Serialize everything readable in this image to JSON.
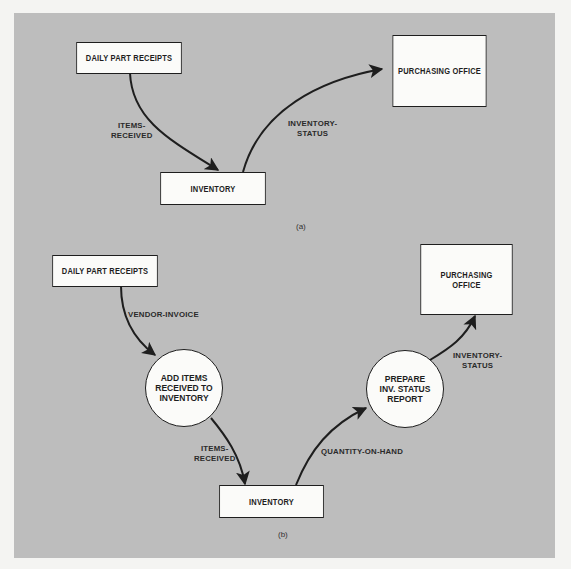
{
  "header_fragment": "● ▪ ▪",
  "diagrams": {
    "a": {
      "caption": "(a)",
      "nodes": {
        "daily_part_receipts": "DAILY PART RECEIPTS",
        "inventory": "INVENTORY",
        "purchasing_office": "PURCHASING OFFICE"
      },
      "flows": {
        "items_received": "ITEMS-\nRECEIVED",
        "inventory_status": "INVENTORY-\nSTATUS"
      }
    },
    "b": {
      "caption": "(b)",
      "nodes": {
        "daily_part_receipts": "DAILY PART RECEIPTS",
        "add_items_process": "ADD ITEMS\nRECEIVED TO\nINVENTORY",
        "inventory": "INVENTORY",
        "prepare_report_process": "PREPARE\nINV. STATUS\nREPORT",
        "purchasing_office": "PURCHASING\nOFFICE"
      },
      "flows": {
        "vendor_invoice": "VENDOR-INVOICE",
        "items_received": "ITEMS-\nRECEIVED",
        "quantity_on_hand": "QUANTITY-ON-HAND",
        "inventory_status": "INVENTORY-\nSTATUS"
      }
    }
  },
  "colors": {
    "panel": "#bdbdbd",
    "box_fill": "#fbfbf9",
    "line": "#1e1e1e",
    "page": "#f4f4f2"
  }
}
